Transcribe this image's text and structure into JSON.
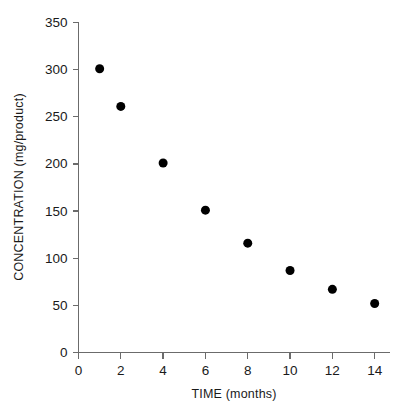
{
  "chart_data": {
    "type": "scatter",
    "title": "",
    "xlabel": "TIME (months)",
    "ylabel": "CONCENTRATION (mg/product)",
    "xlim": [
      0,
      14.7
    ],
    "ylim": [
      0,
      350
    ],
    "xticks": [
      0,
      2,
      4,
      6,
      8,
      10,
      12,
      14
    ],
    "xticklabels": [
      "0",
      "2",
      "4",
      "6",
      "8",
      "10",
      "12",
      "14"
    ],
    "yticks": [
      0,
      50,
      100,
      150,
      200,
      250,
      300,
      350
    ],
    "yticklabels": [
      "0",
      "50",
      "100",
      "150",
      "200",
      "250",
      "300",
      "350"
    ],
    "grid": false,
    "legend": null,
    "marker": {
      "shape": "circle",
      "color": "#000000",
      "size_px": 9
    },
    "x": [
      1,
      2,
      4,
      6,
      8,
      10,
      12,
      14
    ],
    "values": [
      301,
      261,
      201,
      151,
      116,
      87,
      67,
      52
    ],
    "points": [
      {
        "x": 1,
        "y": 301
      },
      {
        "x": 2,
        "y": 261
      },
      {
        "x": 4,
        "y": 201
      },
      {
        "x": 6,
        "y": 151
      },
      {
        "x": 8,
        "y": 116
      },
      {
        "x": 10,
        "y": 87
      },
      {
        "x": 12,
        "y": 67
      },
      {
        "x": 14,
        "y": 52
      }
    ]
  },
  "colors": {
    "background": "#ffffff",
    "axis": "#6b6b6b",
    "text": "#1a1a1a",
    "marker": "#000000"
  }
}
